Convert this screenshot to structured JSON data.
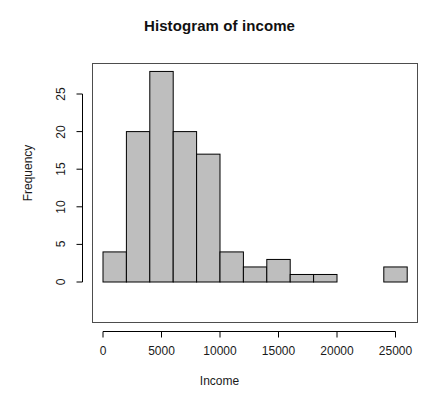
{
  "figure": {
    "title": "Histogram of income",
    "background_color": "#ffffff",
    "bar_fill_color": "#bebebe",
    "bar_border_color": "#000000",
    "axis_color": "#000000",
    "text_color": "#1a1a1a"
  },
  "axes": {
    "xlabel": "Income",
    "ylabel": "Frequency",
    "x_ticks": [
      "0",
      "5000",
      "10000",
      "15000",
      "20000",
      "25000"
    ],
    "y_ticks": [
      "0",
      "5",
      "10",
      "15",
      "20",
      "25"
    ]
  },
  "chart_data": {
    "type": "bar",
    "subtype": "histogram",
    "title": "Histogram of income",
    "xlabel": "Income",
    "ylabel": "Frequency",
    "xlim": [
      0,
      26000
    ],
    "ylim": [
      0,
      28
    ],
    "x_tick_values": [
      0,
      5000,
      10000,
      15000,
      20000,
      25000
    ],
    "y_tick_values": [
      0,
      5,
      10,
      15,
      20,
      25
    ],
    "grid": false,
    "legend": false,
    "bin_width": 2000,
    "bin_edges": [
      0,
      2000,
      4000,
      6000,
      8000,
      10000,
      12000,
      14000,
      16000,
      18000,
      20000,
      22000,
      24000,
      26000
    ],
    "categories": [
      "0-2000",
      "2000-4000",
      "4000-6000",
      "6000-8000",
      "8000-10000",
      "10000-12000",
      "12000-14000",
      "14000-16000",
      "16000-18000",
      "18000-20000",
      "20000-22000",
      "22000-24000",
      "24000-26000"
    ],
    "values": [
      4,
      20,
      28,
      20,
      17,
      4,
      2,
      3,
      1,
      1,
      0,
      0,
      2
    ]
  }
}
